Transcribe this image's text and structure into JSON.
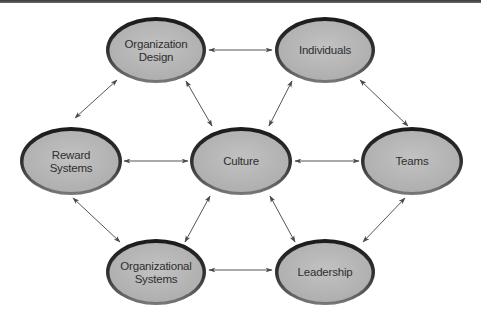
{
  "diagram": {
    "width": 481,
    "height": 322,
    "colors": {
      "background": "#ffffff",
      "node_fill": "#b5b5b5",
      "node_fill_light": "#c4c4c4",
      "node_border_dark": "#1e1e1e",
      "node_border_light": "#6e6e6e",
      "arrow": "#555555",
      "label": "#2e2e2e",
      "top_rule": "#4a4a4a"
    },
    "nodes": [
      {
        "id": "organization-design",
        "lines": [
          "Organization",
          "Design"
        ],
        "cx": 156,
        "cy": 50,
        "rx": 48,
        "ry": 31
      },
      {
        "id": "individuals",
        "lines": [
          "Individuals"
        ],
        "cx": 325,
        "cy": 50,
        "rx": 48,
        "ry": 31
      },
      {
        "id": "reward-systems",
        "lines": [
          "Reward",
          "Systems"
        ],
        "cx": 71,
        "cy": 161,
        "rx": 49,
        "ry": 32
      },
      {
        "id": "culture",
        "lines": [
          "Culture"
        ],
        "cx": 241,
        "cy": 161,
        "rx": 49,
        "ry": 32
      },
      {
        "id": "teams",
        "lines": [
          "Teams"
        ],
        "cx": 412,
        "cy": 161,
        "rx": 49,
        "ry": 32
      },
      {
        "id": "organizational-systems",
        "lines": [
          "Organizational",
          "Systems"
        ],
        "cx": 156,
        "cy": 272,
        "rx": 48,
        "ry": 31
      },
      {
        "id": "leadership",
        "lines": [
          "Leadership"
        ],
        "cx": 325,
        "cy": 272,
        "rx": 48,
        "ry": 31
      }
    ],
    "edges": [
      {
        "from": "organization-design",
        "to": "individuals",
        "x1": 209,
        "y1": 50,
        "x2": 272,
        "y2": 50
      },
      {
        "from": "organization-design",
        "to": "reward-systems",
        "x1": 117,
        "y1": 80,
        "x2": 75,
        "y2": 118
      },
      {
        "from": "organization-design",
        "to": "culture",
        "x1": 186,
        "y1": 81,
        "x2": 212,
        "y2": 126
      },
      {
        "from": "individuals",
        "to": "culture",
        "x1": 292,
        "y1": 81,
        "x2": 269,
        "y2": 126
      },
      {
        "from": "individuals",
        "to": "teams",
        "x1": 360,
        "y1": 80,
        "x2": 408,
        "y2": 126
      },
      {
        "from": "reward-systems",
        "to": "culture",
        "x1": 124,
        "y1": 161,
        "x2": 188,
        "y2": 161
      },
      {
        "from": "culture",
        "to": "teams",
        "x1": 295,
        "y1": 161,
        "x2": 359,
        "y2": 161
      },
      {
        "from": "reward-systems",
        "to": "organizational-systems",
        "x1": 73,
        "y1": 198,
        "x2": 120,
        "y2": 242
      },
      {
        "from": "culture",
        "to": "organizational-systems",
        "x1": 210,
        "y1": 196,
        "x2": 185,
        "y2": 242
      },
      {
        "from": "culture",
        "to": "leadership",
        "x1": 270,
        "y1": 196,
        "x2": 295,
        "y2": 242
      },
      {
        "from": "teams",
        "to": "leadership",
        "x1": 405,
        "y1": 198,
        "x2": 363,
        "y2": 242
      },
      {
        "from": "organizational-systems",
        "to": "leadership",
        "x1": 209,
        "y1": 270,
        "x2": 272,
        "y2": 270
      }
    ]
  }
}
